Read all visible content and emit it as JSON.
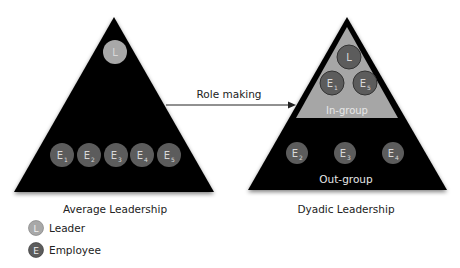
{
  "colors": {
    "triangle": "#000000",
    "in_group_fill": "#a6a6a6",
    "leader_circle": "#a8a8a8",
    "employee_circle": "#5c5c5c",
    "circle_text": "#e0e0e0",
    "label_text": "#222222"
  },
  "arrow": {
    "label": "Role making"
  },
  "average": {
    "title": "Average Leadership",
    "leader": {
      "letter": "L"
    },
    "employees": [
      {
        "letter": "E",
        "sub": "1"
      },
      {
        "letter": "E",
        "sub": "2"
      },
      {
        "letter": "E",
        "sub": "3"
      },
      {
        "letter": "E",
        "sub": "4"
      },
      {
        "letter": "E",
        "sub": "5"
      }
    ]
  },
  "dyadic": {
    "title": "Dyadic Leadership",
    "in_group": {
      "label": "In-group",
      "leader": {
        "letter": "L"
      },
      "members": [
        {
          "letter": "E",
          "sub": "1"
        },
        {
          "letter": "E",
          "sub": "5"
        }
      ]
    },
    "out_group": {
      "label": "Out-group",
      "members": [
        {
          "letter": "E",
          "sub": "2"
        },
        {
          "letter": "E",
          "sub": "3"
        },
        {
          "letter": "E",
          "sub": "4"
        }
      ]
    }
  },
  "legend": [
    {
      "symbol": "L",
      "label": "Leader"
    },
    {
      "symbol": "E",
      "label": "Employee"
    }
  ]
}
